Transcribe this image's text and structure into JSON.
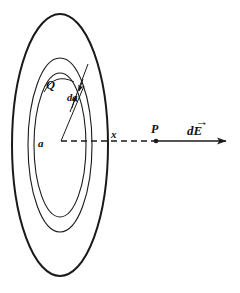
{
  "figure": {
    "background_color": "#ffffff",
    "stroke_color": "#1a1a1a",
    "labels": {
      "charge": "Q",
      "radius": "a",
      "area_element": "da",
      "axial_distance": "x",
      "field_point": "P",
      "field_vector": "dE",
      "field_vector_accent": "→"
    },
    "geometry": {
      "outer_ellipse": {
        "cx": 60,
        "cy": 145,
        "rx": 48,
        "ry": 131,
        "stroke_width": 2.0
      },
      "middle_ellipse": {
        "cx": 60,
        "cy": 145,
        "rx": 32,
        "ry": 87,
        "stroke_width": 1.1
      },
      "inner_ellipse": {
        "cx": 60,
        "cy": 145,
        "rx": 26,
        "ry": 72,
        "stroke_width": 1.1
      },
      "center_point": {
        "x": 61,
        "y": 141
      },
      "field_point_P": {
        "x": 156,
        "y": 141
      },
      "arrow_tip": {
        "x": 232,
        "y": 141
      },
      "arrow_start": {
        "x": 156,
        "y": 141
      },
      "dashed_axis": {
        "x1": 61,
        "y1": 141,
        "x2": 156,
        "y2": 141
      },
      "radius_line": {
        "x1": 61,
        "y1": 141,
        "x2": 83,
        "y2": 88
      }
    },
    "label_positions": {
      "charge": {
        "x": 46,
        "y": 88
      },
      "radius": {
        "x": 40,
        "y": 146
      },
      "area_element": {
        "x": 69,
        "y": 100
      },
      "axial_distance": {
        "x": 112,
        "y": 138
      },
      "field_point": {
        "x": 152,
        "y": 133
      },
      "field_vector": {
        "x": 188,
        "y": 135
      }
    }
  }
}
